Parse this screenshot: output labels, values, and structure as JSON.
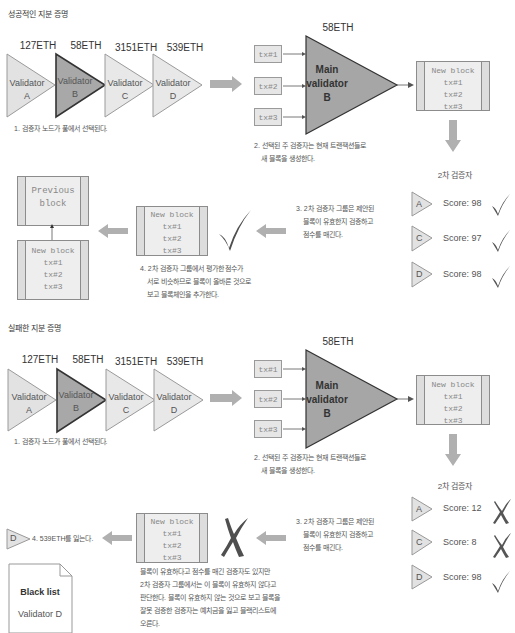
{
  "colors": {
    "triangle_light": "#e2e2e2",
    "triangle_selected": "#a8a8a8",
    "main_validator": "#a6a6a6",
    "arrow": "#b0b0b0",
    "check": "#555555",
    "cross": "#555555"
  },
  "success": {
    "title": "성공적인 지분 증명",
    "validators": [
      {
        "name": "Validator",
        "id": "A",
        "stake": "127ETH",
        "selected": false
      },
      {
        "name": "Validator",
        "id": "B",
        "stake": "58ETH",
        "selected": true
      },
      {
        "name": "Validator",
        "id": "C",
        "stake": "3151ETH",
        "selected": false
      },
      {
        "name": "Validator",
        "id": "D",
        "stake": "539ETH",
        "selected": false
      }
    ],
    "step1": "1. 검증자 노드가 풀에서 선택된다.",
    "main": {
      "stake": "58ETH",
      "line1": "Main",
      "line2": "validator",
      "line3": "B"
    },
    "tx": [
      "tx#1",
      "tx#2",
      "tx#3"
    ],
    "new_block": {
      "title": "New block",
      "tx": [
        "tx#1",
        "tx#2",
        "tx#3"
      ]
    },
    "step2": [
      "2. 선택된 주 검증자는 현재 트랜잭션들로",
      "새 블록을 생성한다."
    ],
    "secondary_title": "2차 검증자",
    "secondary": [
      {
        "id": "A",
        "score": "Score: 98",
        "result": "check"
      },
      {
        "id": "C",
        "score": "Score: 97",
        "result": "check"
      },
      {
        "id": "D",
        "score": "Score: 98",
        "result": "check"
      }
    ],
    "step3": [
      "3. 2차 검증자 그룹은 제안된",
      "블록이 유효한지 검증하고",
      "점수를 매긴다."
    ],
    "step4": [
      "4. 2차 검증자 그룹에서 평가한 점수가",
      "서로 비슷하므로 블록이 올바른 것으로",
      "보고 블록체인을 추가한다."
    ],
    "previous_block": {
      "line1": "Previous",
      "line2": "block"
    },
    "chain_block": {
      "title": "New block",
      "tx": [
        "tx#1",
        "tx#2",
        "tx#3"
      ]
    }
  },
  "failure": {
    "title": "실패한 지분 증명",
    "validators": [
      {
        "name": "Validator",
        "id": "A",
        "stake": "127ETH",
        "selected": false
      },
      {
        "name": "Validator",
        "id": "B",
        "stake": "58ETH",
        "selected": true
      },
      {
        "name": "Validator",
        "id": "C",
        "stake": "3151ETH",
        "selected": false
      },
      {
        "name": "Validator",
        "id": "D",
        "stake": "539ETH",
        "selected": false
      }
    ],
    "step1": "1. 검증자 노드가 풀에서 선택된다.",
    "main": {
      "stake": "58ETH",
      "line1": "Main",
      "line2": "validator",
      "line3": "B"
    },
    "tx": [
      "tx#1",
      "tx#2",
      "tx#3"
    ],
    "new_block": {
      "title": "New block",
      "tx": [
        "tx#1",
        "tx#2",
        "tx#3"
      ]
    },
    "step2": [
      "2. 선택된 주 검증자는 현재 트랜잭션들로",
      "새 블록을 생성한다."
    ],
    "secondary_title": "2차 검증자",
    "secondary": [
      {
        "id": "A",
        "score": "Score: 12",
        "result": "cross"
      },
      {
        "id": "C",
        "score": "Score: 8",
        "result": "cross"
      },
      {
        "id": "D",
        "score": "Score: 98",
        "result": "check"
      }
    ],
    "step3": [
      "3. 2차 검증자 그룹은 제안된",
      "블록이 유효한지 검증하고",
      "점수를 매긴다."
    ],
    "step4_note": [
      "블록이 유효하다고 점수를 매긴 검증자도 있지만",
      "2차 검증자 그룹에서는 이 블록이 유효하지 않다고",
      "판단한다. 블록이 유효하지 않는 것으로 보고 블록을",
      "잘못 검증한 검증자는 예치금을 잃고 블랙리스트에",
      "오른다."
    ],
    "loss_validator": "D",
    "loss_text": "4. 539ETH를 잃는다.",
    "rejected_block": {
      "title": "New block",
      "tx": [
        "tx#1",
        "tx#2",
        "tx#3"
      ]
    },
    "blacklist": {
      "title": "Black list",
      "item": "Validator D"
    }
  }
}
